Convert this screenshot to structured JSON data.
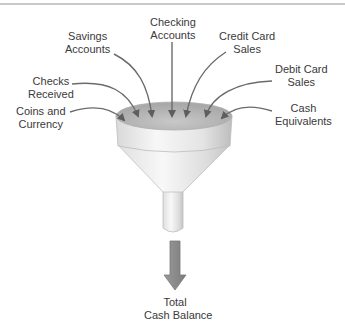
{
  "diagram": {
    "inputs": [
      {
        "line1": "Coins and",
        "line2": "Currency"
      },
      {
        "line1": "Checks",
        "line2": "Received"
      },
      {
        "line1": "Savings",
        "line2": "Accounts"
      },
      {
        "line1": "Checking",
        "line2": "Accounts"
      },
      {
        "line1": "Credit Card",
        "line2": "Sales"
      },
      {
        "line1": "Debit Card",
        "line2": "Sales"
      },
      {
        "line1": "Cash",
        "line2": "Equivalents"
      }
    ],
    "output": {
      "line1": "Total",
      "line2": "Cash Balance"
    },
    "colors": {
      "arrow": "#6b6b6b",
      "funnel_light": "#f2f2f2",
      "funnel_shade": "#b8b8b8",
      "output_arrow": "#8f8f8f",
      "text": "#3a3a3a"
    }
  }
}
